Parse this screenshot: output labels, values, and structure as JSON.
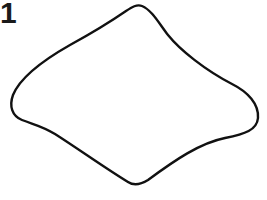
{
  "figure": {
    "label": "1",
    "stroke_color": "#111111",
    "background_color": "#ffffff",
    "outline_path": "M 142 6 C 137 4, 132 7, 126 11 C 110 22, 92 33, 70 45 C 40 62, 20 78, 13 95 C 9 106, 12 116, 22 120 C 35 125, 42 126, 55 134 C 80 150, 105 168, 128 182 C 134 186, 140 185, 148 180 C 175 160, 200 143, 225 138 C 245 134, 257 130, 258 118 C 259 104, 248 92, 232 84 C 205 70, 180 50, 168 35 C 160 25, 152 10, 142 6 Z"
  }
}
